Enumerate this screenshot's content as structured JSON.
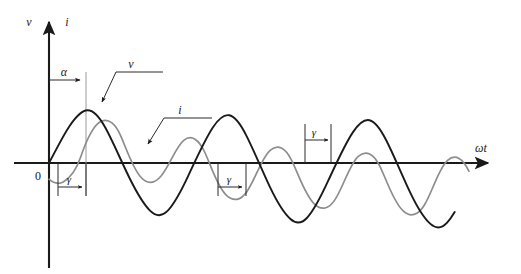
{
  "figure": {
    "kind": "waveform-diagram",
    "background_color": "#ffffff"
  },
  "axes": {
    "vertical": {
      "label_voltage": "v",
      "label_current": "i",
      "x": 49,
      "top_y": 13,
      "bottom_y": 265,
      "color": "#1a1a1a"
    },
    "horizontal": {
      "label": "ωt",
      "y": 163,
      "left_x": 14,
      "right_x": 495,
      "color": "#1a1a1a"
    },
    "origin_label": "0",
    "origin_x": 49,
    "origin_y": 163
  },
  "curves": [
    {
      "name": "v",
      "label": "v",
      "color": "#1a1a1a",
      "stroke_width": 1.9,
      "amplitude": 55,
      "period": 135,
      "phase_x": 49,
      "start_x": 49,
      "end_x": 450,
      "peaks_x": [
        86,
        221,
        356
      ],
      "troughs_x": [
        153,
        288,
        423
      ]
    },
    {
      "name": "i",
      "label": "i",
      "color": "#8d8d8d",
      "stroke_width": 1.7,
      "amplitude": 42,
      "period": 135,
      "phase_x": 77,
      "start_x": 49,
      "end_x": 470,
      "peaks_x": [
        114,
        249,
        384
      ],
      "troughs_x": [
        181,
        316,
        451
      ]
    }
  ],
  "annotations": {
    "alpha": {
      "symbol": "α",
      "from_x": 49,
      "to_x": 85,
      "y": 80,
      "label_x": 64,
      "label_y": 76
    },
    "gamma_markers": [
      {
        "symbol": "γ",
        "from_x": 58,
        "to_x": 86,
        "y": 187,
        "label_x": 68,
        "label_y": 183,
        "position": "below-axis"
      },
      {
        "symbol": "γ",
        "from_x": 218,
        "to_x": 246,
        "y": 187,
        "label_x": 228,
        "label_y": 183,
        "position": "below-axis"
      },
      {
        "symbol": "γ",
        "from_x": 305,
        "to_x": 331,
        "y": 140,
        "label_x": 313,
        "label_y": 135,
        "position": "above-axis"
      }
    ],
    "leaders": [
      {
        "label": "v",
        "label_x": 132,
        "label_y": 74,
        "tip_x": 100,
        "tip_y": 104
      },
      {
        "label": "i",
        "label_x": 180,
        "label_y": 120,
        "tip_x": 145,
        "tip_y": 147
      }
    ]
  }
}
